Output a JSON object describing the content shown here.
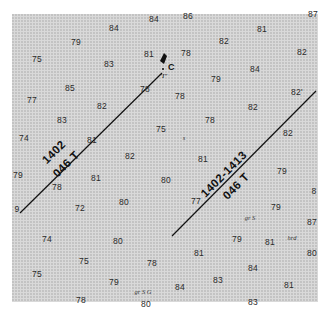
{
  "map": {
    "type": "nautical-chart-fragment",
    "colors": {
      "sheet": "#d9d9d9",
      "ink": "#111111",
      "sounding": "#2a2a2a"
    },
    "soundings": [
      {
        "v": "84",
        "x": 114,
        "y": 28
      },
      {
        "v": "84",
        "x": 154,
        "y": 19
      },
      {
        "v": "86",
        "x": 188,
        "y": 16
      },
      {
        "v": "87",
        "x": 313,
        "y": 14
      },
      {
        "v": "79",
        "x": 76,
        "y": 42
      },
      {
        "v": "81",
        "x": 262,
        "y": 29
      },
      {
        "v": "82",
        "x": 224,
        "y": 41
      },
      {
        "v": "75",
        "x": 37,
        "y": 59
      },
      {
        "v": "83",
        "x": 109,
        "y": 64
      },
      {
        "v": "81",
        "x": 149,
        "y": 54
      },
      {
        "v": "78",
        "x": 186,
        "y": 53
      },
      {
        "v": "82",
        "x": 302,
        "y": 52
      },
      {
        "v": "79",
        "x": 216,
        "y": 79
      },
      {
        "v": "84",
        "x": 255,
        "y": 69
      },
      {
        "v": "85",
        "x": 70,
        "y": 88
      },
      {
        "v": "78",
        "x": 145,
        "y": 89
      },
      {
        "v": "78",
        "x": 180,
        "y": 96
      },
      {
        "v": "82'",
        "x": 297,
        "y": 92
      },
      {
        "v": "77",
        "x": 32,
        "y": 100
      },
      {
        "v": "82",
        "x": 102,
        "y": 106
      },
      {
        "v": "82",
        "x": 253,
        "y": 107
      },
      {
        "v": "83",
        "x": 62,
        "y": 120
      },
      {
        "v": "78",
        "x": 210,
        "y": 120
      },
      {
        "v": "75",
        "x": 161,
        "y": 129
      },
      {
        "v": "74",
        "x": 24,
        "y": 138
      },
      {
        "v": "82",
        "x": 288,
        "y": 133
      },
      {
        "v": "81",
        "x": 92,
        "y": 140
      },
      {
        "v": "82",
        "x": 130,
        "y": 156
      },
      {
        "v": "81",
        "x": 203,
        "y": 159
      },
      {
        "v": "79",
        "x": 18,
        "y": 175
      },
      {
        "v": "81",
        "x": 96,
        "y": 178
      },
      {
        "v": "80",
        "x": 166,
        "y": 180
      },
      {
        "v": "79",
        "x": 282,
        "y": 171
      },
      {
        "v": "78",
        "x": 57,
        "y": 187
      },
      {
        "v": "77",
        "x": 196,
        "y": 201
      },
      {
        "v": "8",
        "x": 314,
        "y": 191
      },
      {
        "v": "79",
        "x": 276,
        "y": 207
      },
      {
        "v": "72",
        "x": 80,
        "y": 208
      },
      {
        "v": "80",
        "x": 124,
        "y": 202
      },
      {
        "v": "87",
        "x": 312,
        "y": 222
      },
      {
        "v": "74",
        "x": 47,
        "y": 239
      },
      {
        "v": "80",
        "x": 118,
        "y": 241
      },
      {
        "v": "79",
        "x": 237,
        "y": 239
      },
      {
        "v": "81",
        "x": 270,
        "y": 242
      },
      {
        "v": "80",
        "x": 312,
        "y": 253
      },
      {
        "v": "81",
        "x": 199,
        "y": 253
      },
      {
        "v": "75",
        "x": 84,
        "y": 261
      },
      {
        "v": "78",
        "x": 152,
        "y": 263
      },
      {
        "v": "84",
        "x": 253,
        "y": 268
      },
      {
        "v": "75",
        "x": 37,
        "y": 274
      },
      {
        "v": "79",
        "x": 114,
        "y": 282
      },
      {
        "v": "83",
        "x": 218,
        "y": 280
      },
      {
        "v": "84",
        "x": 180,
        "y": 287
      },
      {
        "v": "81",
        "x": 289,
        "y": 285
      },
      {
        "v": "78",
        "x": 81,
        "y": 300
      },
      {
        "v": "83",
        "x": 253,
        "y": 302
      },
      {
        "v": "80",
        "x": 146,
        "y": 304
      },
      {
        "v": "9",
        "x": 17,
        "y": 209
      }
    ],
    "notes": [
      {
        "t": "s",
        "x": 184,
        "y": 137
      },
      {
        "t": "gr S",
        "x": 250,
        "y": 217
      },
      {
        "t": "hrd",
        "x": 292,
        "y": 237
      },
      {
        "t": "gr S G",
        "x": 143,
        "y": 291
      }
    ],
    "marker": {
      "label": "C",
      "sub": "\"I\"",
      "x": 162,
      "y": 65
    },
    "bearing_lines": [
      {
        "top": "1402",
        "bottom": "046 T",
        "x1": 20,
        "y1": 213,
        "x2": 162,
        "y2": 73,
        "lx": 60,
        "ly": 158
      },
      {
        "top": "1402-1413",
        "bottom": "046 T",
        "x1": 172,
        "y1": 236,
        "x2": 316,
        "y2": 91,
        "lx": 230,
        "ly": 180
      }
    ]
  }
}
